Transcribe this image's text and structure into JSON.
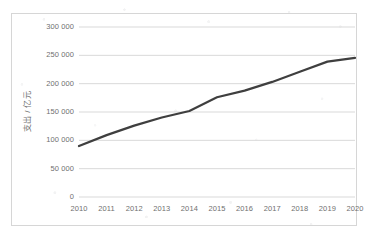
{
  "chart_data": {
    "type": "line",
    "title": "",
    "xlabel": "",
    "ylabel": "支出 / 亿元",
    "categories": [
      "2010",
      "2011",
      "2012",
      "2013",
      "2014",
      "2015",
      "2016",
      "2017",
      "2018",
      "2019",
      "2020"
    ],
    "x": [
      2010,
      2011,
      2012,
      2013,
      2014,
      2015,
      2016,
      2017,
      2018,
      2019,
      2020
    ],
    "values": [
      89900,
      109200,
      125900,
      140200,
      151800,
      176000,
      187800,
      203100,
      220900,
      238900,
      245600
    ],
    "series": [
      {
        "name": "支出",
        "values": [
          89900,
          109200,
          125900,
          140200,
          151800,
          176000,
          187800,
          203100,
          220900,
          238900,
          245600
        ]
      }
    ],
    "ylim": [
      0,
      300000
    ],
    "xlim": [
      2010,
      2020
    ],
    "yticks": [
      0,
      50000,
      100000,
      150000,
      200000,
      250000,
      300000
    ],
    "ytick_labels": [
      "0",
      "50 000",
      "100 000",
      "150 000",
      "200 000",
      "250 000",
      "300 000"
    ],
    "grid": "horizontal",
    "legend": "none",
    "line_color": "#3f3f3f",
    "grid_color": "#d9d9d9",
    "border_color": "#d6d6d6",
    "tick_label_color": "#6f6f6f",
    "line_width": 2.2
  },
  "axes": {
    "y_title": "支出 / 亿元",
    "y_labels": [
      "300 000",
      "250 000",
      "200 000",
      "150 000",
      "100 000",
      "50 000",
      "0"
    ],
    "x_labels": [
      "2010",
      "2011",
      "2012",
      "2013",
      "2014",
      "2015",
      "2016",
      "2017",
      "2018",
      "2019",
      "2020"
    ]
  }
}
